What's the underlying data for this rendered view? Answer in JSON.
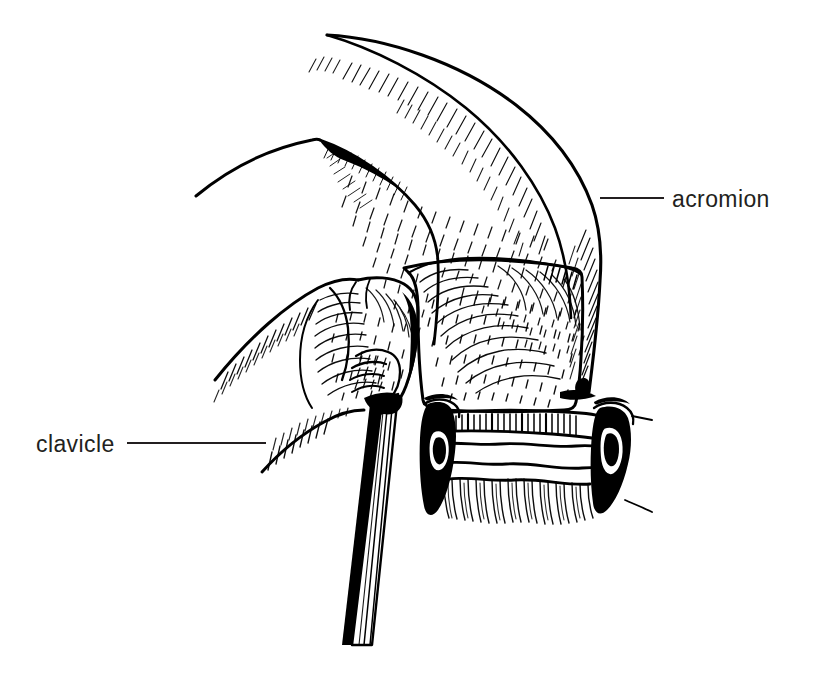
{
  "figure": {
    "background_color": "#ffffff",
    "ink_color": "#000000",
    "text_color": "#231f20",
    "width": 813,
    "height": 673,
    "style": "pen-and-ink line drawing with stipple and hatch shading"
  },
  "labels": [
    {
      "id": "acromion",
      "text": "acromion",
      "text_x": 672,
      "text_y": 207,
      "anchor": "start",
      "leader": {
        "x1": 600,
        "y1": 198,
        "x2": 664,
        "y2": 198
      }
    },
    {
      "id": "clavicle",
      "text": "clavicle",
      "text_x": 36,
      "text_y": 452,
      "anchor": "start",
      "leader": {
        "x1": 127,
        "y1": 443,
        "x2": 266,
        "y2": 443
      }
    }
  ],
  "structures": [
    {
      "id": "acromion-body",
      "name": "acromion"
    },
    {
      "id": "clavicle-body",
      "name": "clavicle"
    },
    {
      "id": "distal-clavicle-end",
      "name": "distal clavicle cut surface"
    },
    {
      "id": "humeral-head",
      "name": "humeral head articular surface"
    },
    {
      "id": "retractor-shaft",
      "name": "retractor shaft"
    },
    {
      "id": "anchor-left",
      "name": "left retractor blade"
    },
    {
      "id": "anchor-right",
      "name": "right retractor blade"
    },
    {
      "id": "capsule-band",
      "name": "joint capsule band"
    }
  ]
}
